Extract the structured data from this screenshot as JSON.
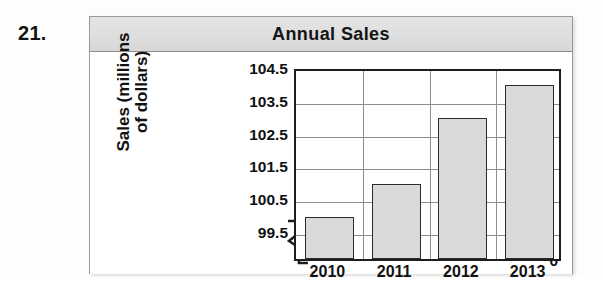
{
  "problem": {
    "number": "21."
  },
  "panel": {
    "title": "Annual Sales"
  },
  "chart_data": {
    "type": "bar",
    "title": "Annual Sales",
    "categories": [
      "2010",
      "2011",
      "2012",
      "2013"
    ],
    "values": [
      100.0,
      101.0,
      103.0,
      104.0
    ],
    "xlabel": "",
    "ylabel": "Sales (millions of dollars)",
    "ylabel_line1": "Sales (millions",
    "ylabel_line2": "of dollars)",
    "ylim": [
      99.5,
      104.5
    ],
    "yticks": [
      "104.5",
      "103.5",
      "102.5",
      "101.5",
      "100.5",
      "99.5"
    ],
    "ytick_values": [
      104.5,
      103.5,
      102.5,
      101.5,
      100.5,
      99.5
    ],
    "zero_tick": "0",
    "axis_break": true,
    "grid": true,
    "legend": "none",
    "bar_fill_color": "#dadada",
    "bar_border_color": "#2b2b2b",
    "title_bar_color": "#dedede"
  }
}
